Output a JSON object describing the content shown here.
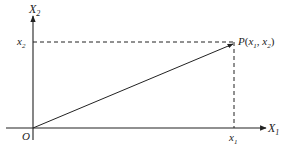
{
  "diagram": {
    "axes": {
      "x_axis_label": "X",
      "x_axis_sub": "1",
      "y_axis_label": "X",
      "y_axis_sub": "2",
      "origin_label": "O"
    },
    "point": {
      "name": "P",
      "coords_text_open": "(",
      "coord1": "x",
      "coord1_sub": "1",
      "sep": ", ",
      "coord2": "x",
      "coord2_sub": "2",
      "coords_text_close": ")"
    },
    "ticks": {
      "x_tick_label": "x",
      "x_tick_sub": "1",
      "y_tick_label": "x",
      "y_tick_sub": "2"
    },
    "colors": {
      "line": "#222222",
      "background": "#ffffff"
    }
  }
}
